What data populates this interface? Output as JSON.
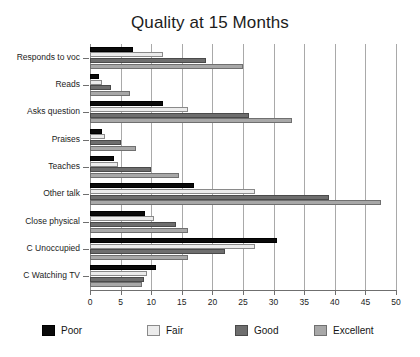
{
  "chart_data": {
    "type": "bar",
    "orientation": "horizontal",
    "title": "Quality at 15 Months",
    "xlabel": "",
    "ylabel": "",
    "xlim": [
      0,
      50
    ],
    "xticks": [
      0,
      5,
      10,
      15,
      20,
      25,
      30,
      35,
      40,
      45,
      50
    ],
    "grid": "vertical",
    "legend_position": "bottom",
    "categories": [
      "Responds to voc",
      "Reads",
      "Asks question",
      "Praises",
      "Teaches",
      "Other talk",
      "Close physical",
      "C Unoccupied",
      "C Watching TV"
    ],
    "series": [
      {
        "name": "Poor",
        "color": "#0a0a0a",
        "values": [
          7.0,
          1.5,
          12.0,
          2.0,
          4.0,
          17.0,
          9.0,
          30.5,
          10.8
        ]
      },
      {
        "name": "Fair",
        "color": "#ececec",
        "values": [
          12.0,
          2.0,
          16.0,
          2.5,
          4.5,
          27.0,
          10.5,
          27.0,
          9.3
        ]
      },
      {
        "name": "Good",
        "color": "#6e6e6e",
        "values": [
          19.0,
          3.5,
          26.0,
          5.0,
          10.0,
          39.0,
          14.0,
          22.0,
          8.8
        ]
      },
      {
        "name": "Excellent",
        "color": "#a8a8a8",
        "values": [
          25.0,
          6.5,
          33.0,
          7.5,
          14.5,
          47.5,
          16.0,
          16.0,
          8.5
        ]
      }
    ]
  },
  "legend": {
    "entries": [
      {
        "label": "Poor"
      },
      {
        "label": "Fair"
      },
      {
        "label": "Good"
      },
      {
        "label": "Excellent"
      }
    ]
  }
}
